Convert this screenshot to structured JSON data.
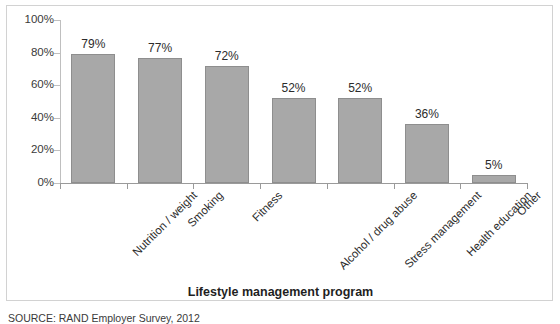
{
  "chart_data": {
    "type": "bar",
    "title": "",
    "categories": [
      "Nutrition / weight",
      "Smoking",
      "Fitness",
      "Alcohol / drug abuse",
      "Stress management",
      "Health education",
      "Other"
    ],
    "values": [
      79,
      77,
      72,
      52,
      52,
      36,
      5
    ],
    "data_labels": [
      "79%",
      "77%",
      "72%",
      "52%",
      "52%",
      "36%",
      "5%"
    ],
    "xlabel": "Lifestyle management program",
    "ylabel": "",
    "ylim": [
      0,
      100
    ],
    "ytick_labels": [
      "100%",
      "80%",
      "60%",
      "40%",
      "20%",
      "0%"
    ],
    "ytick_values": [
      100,
      80,
      60,
      40,
      20,
      0
    ],
    "grid": false,
    "legend": false,
    "bar_color": "#a8a8a8",
    "bar_border_color": "#8e8e8e",
    "axis_color": "#9a9a9a",
    "frame_color": "#d2d2d2",
    "background": "#ffffff"
  },
  "footer": {
    "source": "SOURCE: RAND Employer Survey, 2012"
  }
}
